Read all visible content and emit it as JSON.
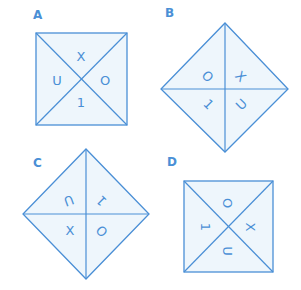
{
  "colors": {
    "line": "#4a8fd6",
    "fill": "#eef6fc",
    "text": "#4a8fd6"
  },
  "figures": [
    {
      "label": "A",
      "shape": "square",
      "symbols": [
        {
          "position": "top",
          "char": "X",
          "rotation": 0
        },
        {
          "position": "right",
          "char": "O",
          "rotation": 0
        },
        {
          "position": "bottom",
          "char": "1",
          "rotation": 0
        },
        {
          "position": "left",
          "char": "U",
          "rotation": 0
        }
      ]
    },
    {
      "label": "B",
      "shape": "diamond",
      "symbols": [
        {
          "position": "top-left",
          "char": "O",
          "rotation": 45
        },
        {
          "position": "top-right",
          "char": "X",
          "rotation": 45
        },
        {
          "position": "bottom-right",
          "char": "U",
          "rotation": -45
        },
        {
          "position": "bottom-left",
          "char": "1",
          "rotation": 45
        }
      ]
    },
    {
      "label": "C",
      "shape": "diamond",
      "symbols": [
        {
          "position": "top-left",
          "char": "U",
          "rotation": 160
        },
        {
          "position": "top-right",
          "char": "1",
          "rotation": 225
        },
        {
          "position": "bottom-right",
          "char": "O",
          "rotation": 45
        },
        {
          "position": "bottom-left",
          "char": "X",
          "rotation": 0
        }
      ]
    },
    {
      "label": "D",
      "shape": "square",
      "symbols": [
        {
          "position": "top",
          "char": "O",
          "rotation": 90
        },
        {
          "position": "right",
          "char": "X",
          "rotation": 90
        },
        {
          "position": "bottom",
          "char": "U",
          "rotation": 90
        },
        {
          "position": "left",
          "char": "1",
          "rotation": 90
        }
      ]
    }
  ]
}
